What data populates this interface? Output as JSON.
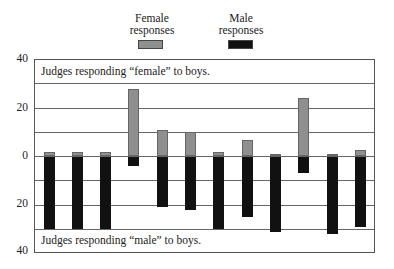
{
  "chart_data": {
    "type": "bar",
    "subtype": "diverging-stacked",
    "title": "",
    "legend": [
      {
        "label": "Female responses",
        "color": "#8f8f8f"
      },
      {
        "label": "Male responses",
        "color": "#111111"
      }
    ],
    "legend_position": "top-center",
    "ylabel": "",
    "xlabel": "",
    "ylim": [
      -40,
      40
    ],
    "ytick_labels": [
      "40",
      "20",
      "0",
      "20",
      "40"
    ],
    "yticks": [
      40,
      20,
      0,
      -20,
      -40
    ],
    "gridlines": [
      30,
      20,
      10,
      0,
      -10,
      -20,
      -30
    ],
    "grid": true,
    "annotations": [
      {
        "text": "Judges responding “female” to boys.",
        "position": "top"
      },
      {
        "text": "Judges responding “male” to boys.",
        "position": "bottom"
      }
    ],
    "categories": [
      "1",
      "2",
      "3",
      "4",
      "5",
      "6",
      "7",
      "8",
      "9",
      "10",
      "11",
      "12"
    ],
    "series": [
      {
        "name": "Female responses",
        "values": [
          2,
          2,
          2,
          28,
          11,
          10,
          2,
          7,
          1,
          24,
          1,
          2.5
        ]
      },
      {
        "name": "Male responses",
        "values": [
          30,
          30,
          30,
          4,
          21,
          22,
          30,
          25,
          31,
          7,
          32,
          29
        ]
      }
    ]
  },
  "legend": {
    "female": {
      "line1": "Female",
      "line2": "responses"
    },
    "male": {
      "line1": "Male",
      "line2": "responses"
    }
  },
  "axis": {
    "t40": "40",
    "t20": "20",
    "t0": "0",
    "b20": "20",
    "b40": "40"
  },
  "annot_top": "Judges responding “female” to boys.",
  "annot_bottom": "Judges responding “male” to boys."
}
